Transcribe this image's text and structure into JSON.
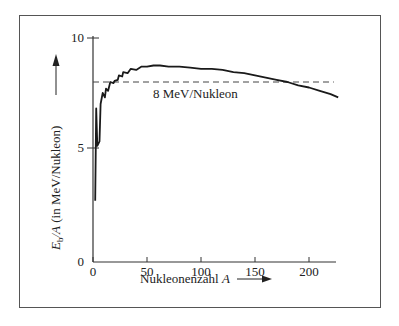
{
  "chart_data": {
    "type": "line",
    "title": "",
    "xlabel": "Nukleonenzahl A",
    "ylabel": "E_b/A (in MeV/Nukleon)",
    "xlim": [
      0,
      225
    ],
    "ylim": [
      0,
      10
    ],
    "x_ticks": [
      0,
      50,
      100,
      150,
      200
    ],
    "y_ticks": [
      0,
      5,
      10
    ],
    "grid": false,
    "legend": null,
    "series": [
      {
        "name": "Bindungsenergie pro Nukleon",
        "x": [
          2,
          3,
          4,
          6,
          7,
          9,
          11,
          12,
          14,
          16,
          19,
          20,
          23,
          24,
          27,
          28,
          32,
          35,
          40,
          45,
          50,
          56,
          62,
          70,
          80,
          90,
          100,
          110,
          120,
          130,
          140,
          150,
          160,
          170,
          180,
          190,
          200,
          210,
          220,
          227
        ],
        "y": [
          2.6,
          6.8,
          5.1,
          5.3,
          7.0,
          7.5,
          7.3,
          7.7,
          7.6,
          8.0,
          7.95,
          8.05,
          8.1,
          8.3,
          8.25,
          8.45,
          8.4,
          8.6,
          8.55,
          8.7,
          8.7,
          8.75,
          8.75,
          8.7,
          8.7,
          8.65,
          8.6,
          8.6,
          8.55,
          8.45,
          8.4,
          8.3,
          8.2,
          8.1,
          8.0,
          7.85,
          7.75,
          7.6,
          7.45,
          7.3
        ]
      }
    ],
    "reference_line": {
      "y": 8,
      "style": "dashed",
      "x_start": 0,
      "x_end": 223
    },
    "annotations": [
      {
        "text": "8 MeV/Nukleon",
        "x": 75,
        "y": 7.6
      }
    ]
  },
  "labels": {
    "x_axis_title": "Nukleonenzahl ",
    "x_axis_var": "A",
    "y_axis_title_E": "E",
    "y_axis_title_sub": "b",
    "y_axis_title_rest": "/A (in MeV/Nukleon)",
    "annotation": "8 MeV/Nukleon",
    "x_ticks": [
      "0",
      "50",
      "100",
      "150",
      "200"
    ],
    "y_ticks": [
      "0",
      "5",
      "10"
    ]
  }
}
